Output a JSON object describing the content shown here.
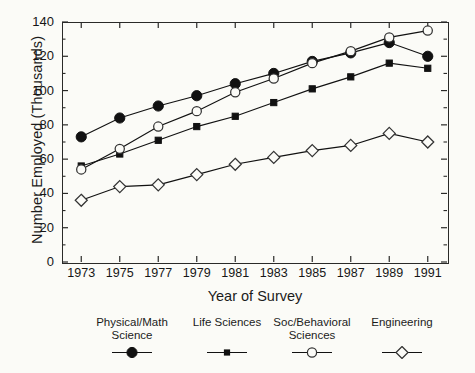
{
  "chart_data": {
    "type": "line",
    "title": "",
    "xlabel": "Year of Survey",
    "ylabel": "Number Employed (Thousands)",
    "x": [
      1973,
      1975,
      1977,
      1979,
      1981,
      1983,
      1985,
      1987,
      1989,
      1991
    ],
    "xticklabels": [
      "1973",
      "1975",
      "1977",
      "1979",
      "1981",
      "1983",
      "1985",
      "1987",
      "1989",
      "1991"
    ],
    "yticklabels": [
      "0",
      "20",
      "40",
      "60",
      "80",
      "100",
      "120",
      "140"
    ],
    "ytickvalues": [
      0,
      20,
      40,
      60,
      80,
      100,
      120,
      140
    ],
    "xlim": [
      1972,
      1992
    ],
    "ylim": [
      0,
      140
    ],
    "grid": false,
    "legend_position": "below",
    "series": [
      {
        "name": "Physical/Math Science",
        "marker": "filled-circle",
        "color": "#111111",
        "values": [
          73,
          84,
          91,
          97,
          104,
          110,
          117,
          122,
          128,
          120
        ]
      },
      {
        "name": "Life Sciences",
        "marker": "filled-square",
        "color": "#111111",
        "values": [
          56,
          63,
          71,
          79,
          85,
          93,
          101,
          108,
          116,
          113
        ]
      },
      {
        "name": "Soc/Behavioral Sciences",
        "marker": "open-circle",
        "color": "#111111",
        "values": [
          54,
          66,
          79,
          88,
          99,
          107,
          116,
          123,
          131,
          135
        ]
      },
      {
        "name": "Engineering",
        "marker": "open-diamond",
        "color": "#111111",
        "values": [
          36,
          44,
          45,
          51,
          57,
          61,
          65,
          68,
          75,
          70
        ]
      }
    ]
  },
  "legend": {
    "items": [
      {
        "line1": "Physical/Math",
        "line2": "Science",
        "marker": "filled-circle"
      },
      {
        "line1": "Life Sciences",
        "line2": "",
        "marker": "filled-square"
      },
      {
        "line1": "Soc/Behavioral",
        "line2": "Sciences",
        "marker": "open-circle"
      },
      {
        "line1": "Engineering",
        "line2": "",
        "marker": "open-diamond"
      }
    ]
  }
}
